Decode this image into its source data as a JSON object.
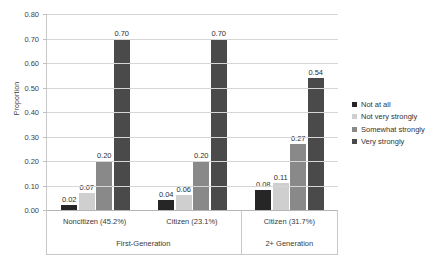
{
  "chart_data": {
    "type": "bar",
    "title": "",
    "xlabel": "",
    "ylabel": "Proportion",
    "ylim": [
      0.0,
      0.8
    ],
    "ytick_labels": [
      "0.80",
      "0.70",
      "0.60",
      "0.50",
      "0.40",
      "0.30",
      "0.20",
      "0.10",
      "0.00"
    ],
    "ytick_values": [
      0.8,
      0.7,
      0.6,
      0.5,
      0.4,
      0.3,
      0.2,
      0.1,
      0.0
    ],
    "grid": true,
    "legend_position": "right",
    "categories": [
      "Noncitizen (45.2%)",
      "Citizen (23.1%)",
      "Citizen (31.7%)"
    ],
    "group_labels": [
      "First-Generation",
      "2+ Generation"
    ],
    "group_spans": [
      2,
      1
    ],
    "series": [
      {
        "name": "Not at all",
        "color": "#262626",
        "values": [
          0.02,
          0.04,
          0.08
        ],
        "labels": [
          "0.02",
          "0.04",
          "0.08"
        ]
      },
      {
        "name": "Not very strongly",
        "color": "#cfcfcf",
        "values": [
          0.07,
          0.06,
          0.11
        ],
        "labels": [
          "0.07",
          "0.06",
          "0.11"
        ]
      },
      {
        "name": "Somewhat strongly",
        "color": "#898989",
        "values": [
          0.2,
          0.2,
          0.27
        ],
        "labels": [
          "0.20",
          "0.20",
          "0.27"
        ]
      },
      {
        "name": "Very strongly",
        "color": "#4a4a4a",
        "values": [
          0.7,
          0.7,
          0.54
        ],
        "labels": [
          "0.70",
          "0.70",
          "0.54"
        ]
      }
    ]
  }
}
